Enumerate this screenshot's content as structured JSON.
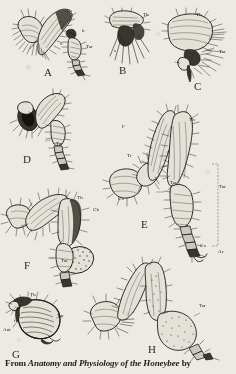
{
  "plate": {
    "title": "Plate of honeybee leg anatomy",
    "background_color": "#eceae5",
    "ink_color": "#1d1a15",
    "width": 236,
    "height": 374
  },
  "caption": {
    "prefix": "From ",
    "work_title": "Anatomy and Physiology of the Honeybee",
    "suffix": " by"
  },
  "figures": [
    {
      "id": "A",
      "letter": "A",
      "letter_x": 44,
      "letter_y": 66,
      "description": "Worker bee hind leg, inner view with pollen press",
      "labels": [
        {
          "text": "Tb",
          "x": 66,
          "y": 8
        },
        {
          "text": "h",
          "x": 82,
          "y": 28
        },
        {
          "text": "s",
          "x": 60,
          "y": 41
        },
        {
          "text": "Tar",
          "x": 86,
          "y": 44
        }
      ]
    },
    {
      "id": "B",
      "letter": "B",
      "letter_x": 119,
      "letter_y": 64,
      "description": "Detail of tibia-tarsus joint, pollen rake and auricle",
      "labels": [
        {
          "text": "Tb",
          "x": 143,
          "y": 12
        },
        {
          "text": "s",
          "x": 114,
          "y": 48
        }
      ]
    },
    {
      "id": "C",
      "letter": "C",
      "letter_x": 194,
      "letter_y": 80,
      "description": "Enlarged pollen press joint with brush",
      "labels": [
        {
          "text": "Tb",
          "x": 196,
          "y": 12
        },
        {
          "text": "Tar",
          "x": 219,
          "y": 49
        },
        {
          "text": "s",
          "x": 177,
          "y": 59
        },
        {
          "text": "h",
          "x": 189,
          "y": 69
        }
      ]
    },
    {
      "id": "D",
      "letter": "D",
      "letter_x": 23,
      "letter_y": 153,
      "description": "Queen hind leg with corbicula region",
      "labels": [
        {
          "text": "Tar",
          "x": 56,
          "y": 141
        }
      ]
    },
    {
      "id": "E",
      "letter": "E",
      "letter_x": 141,
      "letter_y": 218,
      "description": "Complete worker hind leg: coxa, trochanter, femur, tibia, tarsus",
      "labels": [
        {
          "text": "Tb",
          "x": 189,
          "y": 117
        },
        {
          "text": "F",
          "x": 122,
          "y": 124
        },
        {
          "text": "Tr",
          "x": 127,
          "y": 153
        },
        {
          "text": "Tar",
          "x": 170,
          "y": 180
        },
        {
          "text": "Tar",
          "x": 219,
          "y": 184
        },
        {
          "text": "Cx",
          "x": 118,
          "y": 196
        },
        {
          "text": "Cx",
          "x": 200,
          "y": 243
        },
        {
          "text": "Ar",
          "x": 218,
          "y": 249
        }
      ]
    },
    {
      "id": "F",
      "letter": "F",
      "letter_x": 24,
      "letter_y": 259,
      "description": "Hind leg with loaded corbicula carrying pollen pellet",
      "labels": [
        {
          "text": "Tb",
          "x": 77,
          "y": 195
        },
        {
          "text": "Ck",
          "x": 93,
          "y": 207
        },
        {
          "text": "Tar",
          "x": 61,
          "y": 258
        }
      ]
    },
    {
      "id": "G",
      "letter": "G",
      "letter_x": 12,
      "letter_y": 348,
      "description": "Antenna cleaner: notch in basitarsus and tibial spur",
      "labels": [
        {
          "text": "Tb",
          "x": 30,
          "y": 292
        },
        {
          "text": "Tar",
          "x": 57,
          "y": 313
        },
        {
          "text": "f",
          "x": 14,
          "y": 318
        },
        {
          "text": "Ant",
          "x": 3,
          "y": 327
        }
      ]
    },
    {
      "id": "H",
      "letter": "H",
      "letter_x": 148,
      "letter_y": 343,
      "description": "Drone hind leg, lacking pollen-collecting structures",
      "labels": [
        {
          "text": "Tar",
          "x": 199,
          "y": 303
        }
      ]
    }
  ],
  "abbreviations": {
    "Tb": "tibia",
    "Tar": "tarsus",
    "F": "femur",
    "Tr": "trochanter",
    "Cx": "coxa",
    "Ar": "arolium",
    "Ck": "corbicula",
    "Ant": "antenna",
    "h": "hair",
    "s": "spur",
    "f": "fibula"
  }
}
